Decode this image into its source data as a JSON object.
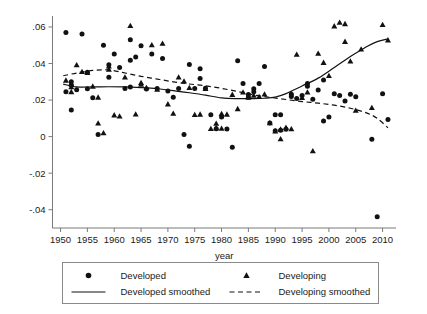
{
  "chart_data": {
    "type": "scatter",
    "title": "",
    "xlabel": "year",
    "ylabel": "",
    "xlim": [
      1948.5,
      2012.5
    ],
    "ylim": [
      -0.05,
      0.066
    ],
    "grid": false,
    "legend_position": "below-axes",
    "xticks": [
      1950,
      1955,
      1960,
      1965,
      1970,
      1975,
      1980,
      1985,
      1990,
      1995,
      2000,
      2005,
      2010
    ],
    "xtick_labels": [
      "1950",
      "1955",
      "1960",
      "1965",
      "1970",
      "1975",
      "1980",
      "1985",
      "1990",
      "1995",
      "2000",
      "2005",
      "2010"
    ],
    "yticks": [
      -0.04,
      -0.02,
      0,
      0.02,
      0.04,
      0.06
    ],
    "ytick_labels": [
      "-.04",
      "-.02",
      "0",
      ".02",
      ".04",
      ".06"
    ],
    "series": [
      {
        "name": "Developed",
        "marker": "circle",
        "color": "#111111",
        "points": [
          [
            1951,
            0.057
          ],
          [
            1951,
            0.0245
          ],
          [
            1952,
            0.03
          ],
          [
            1952,
            0.0283
          ],
          [
            1952,
            0.0145
          ],
          [
            1953,
            0.0257
          ],
          [
            1954,
            0.0562
          ],
          [
            1955,
            0.0352
          ],
          [
            1955,
            0.0262
          ],
          [
            1956,
            0.0213
          ],
          [
            1957,
            0.0012
          ],
          [
            1958,
            0.05
          ],
          [
            1959,
            0.0325
          ],
          [
            1959,
            0.0393
          ],
          [
            1960,
            0.0452
          ],
          [
            1961,
            0.0378
          ],
          [
            1962,
            0.0263
          ],
          [
            1963,
            0.053
          ],
          [
            1963,
            0.0418
          ],
          [
            1963,
            0.0272
          ],
          [
            1964,
            0.0435
          ],
          [
            1965,
            0.0497
          ],
          [
            1966,
            0.026
          ],
          [
            1967,
            0.0452
          ],
          [
            1968,
            0.0263
          ],
          [
            1969,
            0.0427
          ],
          [
            1970,
            0.025
          ],
          [
            1971,
            0.0215
          ],
          [
            1972,
            0.0263
          ],
          [
            1973,
            0.0012
          ],
          [
            1974,
            0.0395
          ],
          [
            1974,
            -0.0053
          ],
          [
            1975,
            0.0263
          ],
          [
            1976,
            0.0372
          ],
          [
            1976,
            0.0318
          ],
          [
            1977,
            0.0265
          ],
          [
            1978,
            0.012
          ],
          [
            1979,
            0.0043
          ],
          [
            1980,
            0.0108
          ],
          [
            1981,
            0.0042
          ],
          [
            1982,
            -0.0058
          ],
          [
            1983,
            0.0415
          ],
          [
            1984,
            0.029
          ],
          [
            1985,
            0.023
          ],
          [
            1985,
            0.0215
          ],
          [
            1986,
            0.0262
          ],
          [
            1986,
            0.0245
          ],
          [
            1987,
            0.029
          ],
          [
            1988,
            0.0383
          ],
          [
            1989,
            0.0075
          ],
          [
            1990,
            0.012
          ],
          [
            1990,
            0.0032
          ],
          [
            1991,
            0.0035
          ],
          [
            1991,
            0.012
          ],
          [
            1992,
            0.004
          ],
          [
            1993,
            0.022
          ],
          [
            1993,
            0.0232
          ],
          [
            1994,
            0.0208
          ],
          [
            1995,
            0.0225
          ],
          [
            1996,
            0.029
          ],
          [
            1996,
            0.0275
          ],
          [
            1997,
            0.0205
          ],
          [
            1998,
            0.0255
          ],
          [
            1999,
            0.031
          ],
          [
            1999,
            0.0085
          ],
          [
            2000,
            0.0108
          ],
          [
            2001,
            0.0235
          ],
          [
            2002,
            0.0225
          ],
          [
            2003,
            0.0195
          ],
          [
            2004,
            0.0232
          ],
          [
            2005,
            0.0218
          ],
          [
            2008,
            -0.0015
          ],
          [
            2009,
            -0.0438
          ],
          [
            2010,
            0.0235
          ],
          [
            2011,
            0.0093
          ]
        ]
      },
      {
        "name": "Developing",
        "marker": "triangle",
        "color": "#111111",
        "points": [
          [
            1951,
            0.0308
          ],
          [
            1952,
            0.0288
          ],
          [
            1952,
            0.0272
          ],
          [
            1952,
            0.0245
          ],
          [
            1953,
            0.0392
          ],
          [
            1954,
            0.0355
          ],
          [
            1955,
            0.035
          ],
          [
            1956,
            0.0275
          ],
          [
            1957,
            0.0215
          ],
          [
            1957,
            0.0073
          ],
          [
            1958,
            0.002
          ],
          [
            1959,
            0.0368
          ],
          [
            1959,
            0.0385
          ],
          [
            1960,
            0.0118
          ],
          [
            1961,
            0.0112
          ],
          [
            1962,
            0.0325
          ],
          [
            1963,
            0.0607
          ],
          [
            1964,
            0.0123
          ],
          [
            1965,
            0.0295
          ],
          [
            1965,
            0.0285
          ],
          [
            1966,
            0.0268
          ],
          [
            1967,
            0.0502
          ],
          [
            1968,
            0.0258
          ],
          [
            1969,
            0.051
          ],
          [
            1970,
            0.0178
          ],
          [
            1971,
            0.0127
          ],
          [
            1972,
            0.0325
          ],
          [
            1973,
            0.0303
          ],
          [
            1974,
            0.0268
          ],
          [
            1975,
            0.012
          ],
          [
            1976,
            0.0122
          ],
          [
            1977,
            0.0262
          ],
          [
            1978,
            0.0043
          ],
          [
            1979,
            0.0048
          ],
          [
            1979,
            0.0072
          ],
          [
            1980,
            0.0045
          ],
          [
            1980,
            0.0125
          ],
          [
            1981,
            0.0122
          ],
          [
            1982,
            0.023
          ],
          [
            1983,
            0.0152
          ],
          [
            1984,
            0.0243
          ],
          [
            1985,
            0.0215
          ],
          [
            1986,
            0.0225
          ],
          [
            1987,
            0.0218
          ],
          [
            1988,
            0.0232
          ],
          [
            1989,
            0.0075
          ],
          [
            1990,
            0.003
          ],
          [
            1991,
            0.004
          ],
          [
            1991,
            -0.0013
          ],
          [
            1992,
            0.005
          ],
          [
            1993,
            0.0042
          ],
          [
            1994,
            0.045
          ],
          [
            1995,
            0.0213
          ],
          [
            1996,
            0.0243
          ],
          [
            1997,
            -0.0078
          ],
          [
            1998,
            0.0455
          ],
          [
            1999,
            0.0405
          ],
          [
            2000,
            0.0333
          ],
          [
            2001,
            0.0605
          ],
          [
            2002,
            0.0625
          ],
          [
            2003,
            0.052
          ],
          [
            2003,
            0.0617
          ],
          [
            2004,
            0.0413
          ],
          [
            2005,
            0.0143
          ],
          [
            2006,
            0.0478
          ],
          [
            2008,
            0.0158
          ],
          [
            2010,
            0.0612
          ],
          [
            2011,
            0.0528
          ]
        ]
      },
      {
        "name": "Developed smoothed",
        "marker": "line-solid",
        "color": "#111111",
        "x": [
          1950.5,
          1953,
          1956,
          1959,
          1962,
          1965,
          1968,
          1971,
          1974,
          1977,
          1980,
          1983,
          1986,
          1988,
          1990,
          1992,
          1995,
          1998,
          2001,
          2004,
          2007,
          2009,
          2011
        ],
        "y": [
          0.0287,
          0.0272,
          0.0272,
          0.0273,
          0.0272,
          0.0268,
          0.0262,
          0.0252,
          0.024,
          0.0227,
          0.0212,
          0.0208,
          0.0208,
          0.021,
          0.0216,
          0.0235,
          0.0277,
          0.032,
          0.0378,
          0.0438,
          0.0492,
          0.052,
          0.0535
        ]
      },
      {
        "name": "Developing smoothed",
        "marker": "line-dashed",
        "color": "#111111",
        "x": [
          1950.5,
          1953,
          1956,
          1959,
          1962,
          1965,
          1968,
          1971,
          1974,
          1977,
          1980,
          1983,
          1986,
          1989,
          1992,
          1995,
          1998,
          2001,
          2004,
          2007,
          2009,
          2011
        ],
        "y": [
          0.0333,
          0.0348,
          0.0362,
          0.0365,
          0.0348,
          0.033,
          0.0315,
          0.03,
          0.0288,
          0.0278,
          0.0264,
          0.0247,
          0.0228,
          0.0215,
          0.0203,
          0.0192,
          0.0183,
          0.0172,
          0.0155,
          0.013,
          0.01,
          0.0048
        ]
      }
    ],
    "legend_entries": [
      {
        "label": "Developed",
        "marker": "circle"
      },
      {
        "label": "Developing",
        "marker": "triangle"
      },
      {
        "label": "Developed smoothed",
        "marker": "line-solid"
      },
      {
        "label": "Developing smoothed",
        "marker": "line-dashed"
      }
    ]
  }
}
